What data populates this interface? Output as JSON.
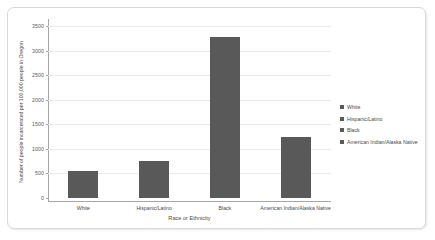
{
  "chart_data": {
    "type": "bar",
    "title": "",
    "categories": [
      "White",
      "Hispanic/Latino",
      "Black",
      "American Indian/Alaska Native"
    ],
    "values": [
      550,
      750,
      3275,
      1240
    ],
    "xlabel": "Race or Ethnicity",
    "ylabel": "Number of people incarcerated per 100,000 people in Oregon",
    "ylim": [
      0,
      3500
    ],
    "ytick_labels": [
      "0",
      "500",
      "1000",
      "1500",
      "2000",
      "2500",
      "3000",
      "3500"
    ],
    "ytick_values": [
      0,
      500,
      1000,
      1500,
      2000,
      2500,
      3000,
      3500
    ],
    "grid": true,
    "legend_position": "right",
    "legend": [
      {
        "label": "White",
        "color": "#595959"
      },
      {
        "label": "Hispanic/Latino",
        "color": "#595959"
      },
      {
        "label": "Black",
        "color": "#595959"
      },
      {
        "label": "American Indian/Alaska Native",
        "color": "#595959"
      }
    ],
    "bar_color": "#595959",
    "axis_color": "#a6a6a6",
    "grid_color": "#eceaea",
    "background": "#ffffff"
  }
}
